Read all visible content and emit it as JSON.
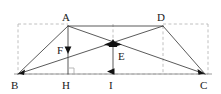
{
  "figure": {
    "kind": "geometry-diagram",
    "canvas": {
      "width": 221,
      "height": 94
    },
    "colors": {
      "solid_stroke": "#3c3c3c",
      "dashed_stroke": "#b9b9b9",
      "baseline_stroke": "#8c8c8c",
      "label_text": "#1a1a1a",
      "arrow_fill": "#111111",
      "background": "#ffffff"
    },
    "points": [
      {
        "id": "A",
        "label": "A",
        "x": 68,
        "y": 26,
        "label_x": 62,
        "label_y": 12
      },
      {
        "id": "D",
        "label": "D",
        "x": 163,
        "y": 26,
        "label_x": 157,
        "label_y": 12
      },
      {
        "id": "B",
        "label": "B",
        "x": 18,
        "y": 74,
        "label_x": 11,
        "label_y": 80
      },
      {
        "id": "C",
        "label": "C",
        "x": 205,
        "y": 74,
        "label_x": 200,
        "label_y": 80
      },
      {
        "id": "H",
        "label": "H",
        "x": 68,
        "y": 74,
        "label_x": 62,
        "label_y": 80
      },
      {
        "id": "I",
        "label": "I",
        "x": 113,
        "y": 74,
        "label_x": 109,
        "label_y": 80
      },
      {
        "id": "E",
        "label": "E",
        "x": 113,
        "y": 44,
        "label_x": 118,
        "label_y": 51
      },
      {
        "id": "F",
        "label": "F",
        "x": 68,
        "y": 50,
        "label_x": 57,
        "label_y": 45
      }
    ],
    "solid_segments": [
      {
        "name": "segment-AD",
        "from": "A",
        "to": "D"
      },
      {
        "name": "segment-AB",
        "from": "A",
        "to": "B"
      },
      {
        "name": "segment-AH",
        "from": "A",
        "to": "H"
      },
      {
        "name": "segment-AC",
        "from": "A",
        "to": "C"
      },
      {
        "name": "segment-BD",
        "from": "B",
        "to": "D"
      },
      {
        "name": "segment-DC",
        "from": "D",
        "to": "C"
      },
      {
        "name": "segment-EI",
        "from": "E",
        "to": "I"
      },
      {
        "name": "segment-BC",
        "from": "B",
        "to": "C"
      }
    ],
    "dashed_segments": [
      {
        "name": "dashed-top-left",
        "x1": 18,
        "y1": 24,
        "x2": 68,
        "y2": 24
      },
      {
        "name": "dashed-top-right",
        "x1": 163,
        "y1": 24,
        "x2": 208,
        "y2": 24
      },
      {
        "name": "dashed-left-edge",
        "x1": 18,
        "y1": 24,
        "x2": 18,
        "y2": 74
      },
      {
        "name": "dashed-right-edge",
        "x1": 208,
        "y1": 24,
        "x2": 208,
        "y2": 74
      },
      {
        "name": "dashed-bottom-edge",
        "x1": 18,
        "y1": 74,
        "x2": 208,
        "y2": 74
      },
      {
        "name": "dashed-vertical-EI",
        "x1": 113,
        "y1": 24,
        "x2": 113,
        "y2": 44
      },
      {
        "name": "dashed-vertical-D",
        "x1": 163,
        "y1": 26,
        "x2": 163,
        "y2": 74
      }
    ],
    "arrows": [
      {
        "name": "arrow-F-down",
        "x": 68,
        "y": 52,
        "direction": "down"
      },
      {
        "name": "arrow-E-up",
        "x": 113,
        "y": 42,
        "direction": "up"
      },
      {
        "name": "arrow-I-left",
        "x": 110,
        "y": 71,
        "direction": "left"
      },
      {
        "name": "arrow-B-in",
        "x": 21,
        "y": 72,
        "direction": "downleft"
      },
      {
        "name": "arrow-C-in",
        "x": 202,
        "y": 72,
        "direction": "downright"
      }
    ],
    "right_angle_markers": [
      {
        "name": "right-angle-at-H",
        "x": 68,
        "y": 74,
        "size": 6,
        "open": "upright"
      }
    ]
  }
}
